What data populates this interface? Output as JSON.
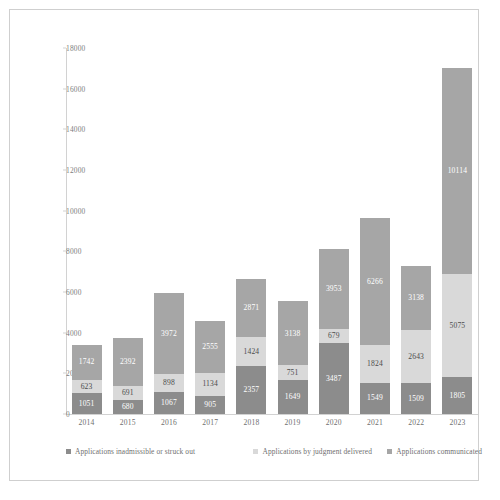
{
  "chart_data": {
    "type": "bar",
    "subtype": "stacked-vertical",
    "title": "",
    "xlabel": "",
    "ylabel": "",
    "ylim": [
      0,
      18000
    ],
    "ytick_step": 2000,
    "yticks": [
      "0",
      "2000",
      "4000",
      "6000",
      "8000",
      "10000",
      "12000",
      "14000",
      "16000",
      "18000"
    ],
    "grid": false,
    "legend_position": "bottom",
    "categories": [
      "2014",
      "2015",
      "2016",
      "2017",
      "2018",
      "2019",
      "2020",
      "2021",
      "2022",
      "2023"
    ],
    "stack_order_bottom_to_top": [
      "Applications inadmissible or struck out",
      "Applications by judgment delivered",
      "Applications communicated"
    ],
    "series": [
      {
        "name": "Applications inadmissible or struck out",
        "color": "#8c8c8c",
        "values": [
          1051,
          680,
          1067,
          905,
          2357,
          1649,
          3487,
          1549,
          1509,
          1805
        ]
      },
      {
        "name": "Applications by judgment delivered",
        "color": "#d9d9d9",
        "values": [
          623,
          691,
          898,
          1134,
          1424,
          751,
          679,
          1824,
          2643,
          5075
        ]
      },
      {
        "name": "Applications communicated",
        "color": "#a6a6a6",
        "values": [
          1742,
          2392,
          3972,
          2555,
          2871,
          3138,
          3953,
          6266,
          3138,
          10114
        ]
      }
    ],
    "totals": [
      3416,
      3763,
      5937,
      4594,
      6652,
      5538,
      8119,
      9639,
      7290,
      16994
    ]
  },
  "legend": {
    "items": [
      {
        "label": "Applications inadmissible or struck out",
        "color": "#8c8c8c"
      },
      {
        "label": "Applications by judgment delivered",
        "color": "#d9d9d9"
      },
      {
        "label": "Applications communicated",
        "color": "#a6a6a6"
      }
    ]
  }
}
